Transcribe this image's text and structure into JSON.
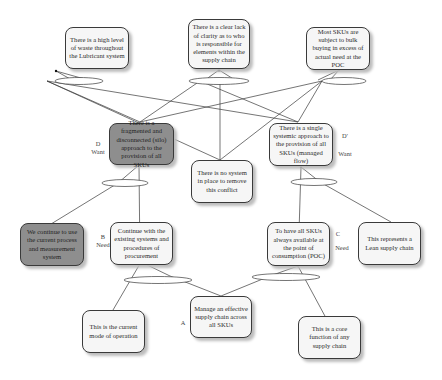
{
  "diagram": {
    "type": "evaporating-cloud / conflict resolution diagram",
    "nodes": {
      "top_waste": {
        "text": "There is a high level of waste throughout the Lubricant system"
      },
      "top_clarity": {
        "text": "There is a clear lack of clarity as to who is responsible for elements within the supply chain"
      },
      "top_bulk": {
        "text": "Most SKUs are subject to bulk buying in excess of actual need at the POC"
      },
      "d_want": {
        "text": "There is a fragmented and disconnected (silo) approach to the provision of all SKUs",
        "shaded": true
      },
      "d_prime_want": {
        "text": "There is a single systemic approach to the provision of all SKUs (managed flow)"
      },
      "no_system": {
        "text": "There is no system in place to remove this conflict"
      },
      "b_assumption": {
        "text": "We continue to use the current process and measurement system",
        "shaded": true
      },
      "b_need": {
        "text": "Continue with the existing systems and procedures of procurement"
      },
      "c_need": {
        "text": "To have all SKUs always available at the point of consumption (POC)"
      },
      "c_assumption": {
        "text": "This represents a Lean supply chain"
      },
      "current_mode": {
        "text": "This is the current mode of operation"
      },
      "a_objective": {
        "text": "Manage an effective supply chain across all SKUs"
      },
      "core_function": {
        "text": "This is a core function of any supply chain"
      }
    },
    "labels": {
      "d": "D",
      "d_want": "Want",
      "d_prime": "D'",
      "d_prime_want": "Want",
      "b": "B",
      "b_need": "Need",
      "c": "C",
      "c_need": "Need",
      "a": "A"
    },
    "colors": {
      "line": "#3a3a3a",
      "box_fill": "#f6f6f6",
      "box_shaded": "#8e8e8e",
      "shadow": "#bdbdbd"
    }
  }
}
